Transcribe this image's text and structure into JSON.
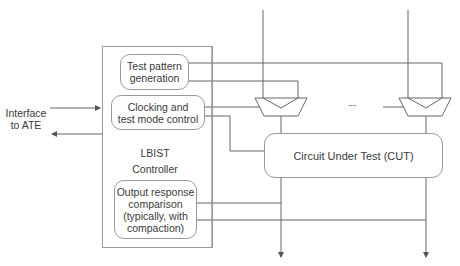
{
  "diagram": {
    "interface": {
      "line1": "Interface",
      "line2": "to ATE"
    },
    "controller": {
      "title_line1": "LBIST",
      "title_line2": "Controller",
      "blocks": {
        "tpg": {
          "line1": "Test pattern",
          "line2": "generation"
        },
        "clocking": {
          "line1": "Clocking and",
          "line2": "test mode control"
        },
        "ora": {
          "line1": "Output response",
          "line2": "comparison",
          "line3": "(typically, with",
          "line4": "compaction)"
        }
      }
    },
    "cut": {
      "label": "Circuit Under Test (CUT)"
    },
    "ellipsis": "....",
    "colors": {
      "line": "#555555",
      "box_border": "#9a9a9a",
      "text": "#3a3a3a"
    }
  }
}
